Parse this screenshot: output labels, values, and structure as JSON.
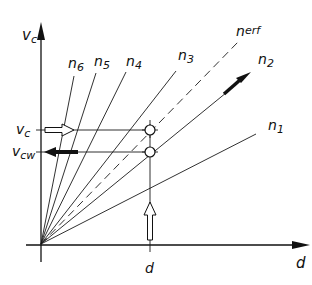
{
  "diagram": {
    "axes": {
      "y_label": "v",
      "y_label_sub": "c",
      "x_label": "d"
    },
    "rays": [
      {
        "name": "n1",
        "label": "n",
        "sub": "1",
        "style": "solid"
      },
      {
        "name": "n2",
        "label": "n",
        "sub": "2",
        "style": "solid"
      },
      {
        "name": "n_erf",
        "label": "n",
        "sub": "erf",
        "style": "dashed"
      },
      {
        "name": "n3",
        "label": "n",
        "sub": "3",
        "style": "solid"
      },
      {
        "name": "n4",
        "label": "n",
        "sub": "4",
        "style": "solid"
      },
      {
        "name": "n5",
        "label": "n",
        "sub": "5",
        "style": "solid"
      },
      {
        "name": "n6",
        "label": "n",
        "sub": "6",
        "style": "solid"
      }
    ],
    "markers": {
      "vc": {
        "label": "v",
        "sub": "c"
      },
      "vcw": {
        "label": "v",
        "sub": "cw"
      },
      "d": {
        "label": "d"
      }
    },
    "colors": {
      "ink": "#111111",
      "background": "#ffffff"
    }
  }
}
